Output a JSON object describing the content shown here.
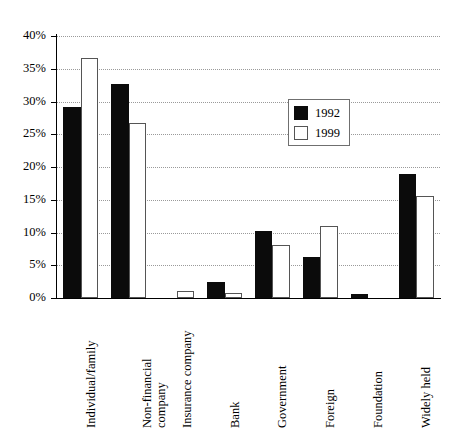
{
  "chart_data": {
    "type": "bar",
    "title": "",
    "subtitle": "",
    "xlabel": "",
    "ylabel": "",
    "ylim": [
      0,
      40
    ],
    "ytick_labels": [
      "0%",
      "5%",
      "10%",
      "15%",
      "20%",
      "25%",
      "30%",
      "35%",
      "40%"
    ],
    "ytick_values": [
      0,
      5,
      10,
      15,
      20,
      25,
      30,
      35,
      40
    ],
    "grid": true,
    "grid_axis": "y",
    "grid_style": "dotted",
    "legend_position": "upper-center-right",
    "categories": [
      "Individual/family",
      "Non-financial company",
      "Insurance company",
      "Bank",
      "Government",
      "Foreign",
      "Foundation",
      "Widely held"
    ],
    "category_lines": [
      [
        "Individual/family"
      ],
      [
        "Non-financial",
        "company"
      ],
      [
        "Insurance company"
      ],
      [
        "Bank"
      ],
      [
        "Government"
      ],
      [
        "Foreign"
      ],
      [
        "Foundation"
      ],
      [
        "Widely held"
      ]
    ],
    "series": [
      {
        "name": "1992",
        "color": "#0b0b0b",
        "fill": "solid-black",
        "values": [
          29.2,
          32.6,
          0.0,
          2.5,
          10.2,
          6.2,
          0.6,
          19.0
        ]
      },
      {
        "name": "1999",
        "color": "#ffffff",
        "fill": "white-outlined",
        "values": [
          36.6,
          26.7,
          1.1,
          0.7,
          8.1,
          11.0,
          0.0,
          15.5
        ]
      }
    ]
  },
  "legend": {
    "entries": [
      {
        "label": "1992"
      },
      {
        "label": "1999"
      }
    ]
  },
  "colors": {
    "series_1992": "#0b0b0b",
    "series_1999": "#ffffff",
    "axis": "#000000",
    "gridline": "#9a9a9a",
    "background": "#ffffff"
  }
}
